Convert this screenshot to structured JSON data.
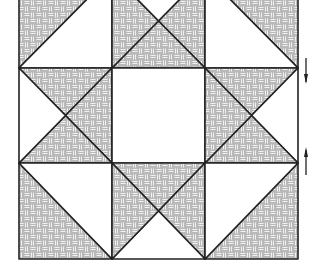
{
  "diagram": {
    "grid": {
      "cols": 3,
      "rows": 3,
      "x": [
        19,
        112,
        205,
        298
      ],
      "y": [
        -26,
        68,
        163,
        259
      ]
    },
    "colors": {
      "shaded": "#b9b9b9",
      "weave": "#f2f2f2",
      "line": "#222222",
      "background": "#ffffff"
    },
    "cells": [
      {
        "col": 0,
        "row": 0,
        "type": "half-square",
        "shaded": "top-left"
      },
      {
        "col": 1,
        "row": 0,
        "type": "quarter-square",
        "white": [
          "top"
        ]
      },
      {
        "col": 2,
        "row": 0,
        "type": "half-square",
        "shaded": "top-right"
      },
      {
        "col": 0,
        "row": 1,
        "type": "quarter-square",
        "white": [
          "left"
        ]
      },
      {
        "col": 1,
        "row": 1,
        "type": "plain",
        "shaded": "none"
      },
      {
        "col": 2,
        "row": 1,
        "type": "quarter-square",
        "white": [
          "right"
        ]
      },
      {
        "col": 0,
        "row": 2,
        "type": "half-square",
        "shaded": "bottom-left"
      },
      {
        "col": 1,
        "row": 2,
        "type": "quarter-square",
        "white": [
          "bottom"
        ]
      },
      {
        "col": 2,
        "row": 2,
        "type": "half-square",
        "shaded": "bottom-right"
      }
    ],
    "arrows": [
      {
        "direction": "down",
        "x": 306,
        "y1": 58,
        "y2": 82
      },
      {
        "direction": "up",
        "x": 306,
        "y1": 175,
        "y2": 148
      }
    ]
  }
}
